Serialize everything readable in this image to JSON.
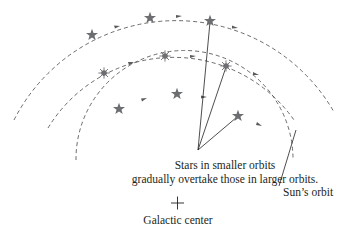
{
  "diagram": {
    "caption_line1": "Stars in smaller orbits",
    "caption_line2": "gradually overtake those in larger orbits.",
    "sun_orbit_label": "Sun’s orbit",
    "center_label": "Galactic center",
    "colors": {
      "orbit": "#5a5a5a",
      "star": "#6d6e71",
      "pointer_line": "#231f20",
      "text": "#231f20"
    },
    "orbits": [
      {
        "name": "outer",
        "stars": [
          "star",
          "star",
          "star"
        ]
      },
      {
        "name": "middle",
        "stars": [
          "burst-star",
          "burst-star",
          "burst-star"
        ]
      },
      {
        "name": "inner-sun-orbit",
        "stars": [
          "star",
          "star",
          "star"
        ]
      }
    ]
  }
}
